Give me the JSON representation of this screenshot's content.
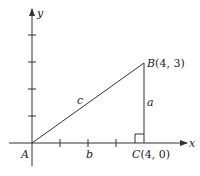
{
  "diagram": {
    "type": "right-triangle-on-coordinate-plane",
    "axes": {
      "x_label": "x",
      "y_label": "y",
      "x_ticks": [
        1,
        2,
        3,
        4
      ],
      "y_ticks": [
        1,
        2,
        3,
        4
      ]
    },
    "points": {
      "A": {
        "label": "A",
        "coords": [
          0,
          0
        ]
      },
      "B": {
        "label": "B",
        "coords_text": "(4, 3)",
        "coords": [
          4,
          3
        ]
      },
      "C": {
        "label": "C",
        "coords_text": "(4, 0)",
        "coords": [
          4,
          0
        ]
      }
    },
    "sides": {
      "a": "a",
      "b": "b",
      "c": "c"
    },
    "right_angle_at": "C",
    "colors": {
      "line": "#333333",
      "background": "#ffffff"
    }
  }
}
